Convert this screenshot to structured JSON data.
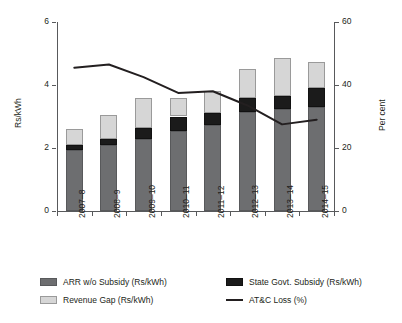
{
  "chart_data": {
    "type": "bar",
    "title": "",
    "subtitle": "",
    "xlabel": "",
    "ylabel": "Rs/kWh",
    "y2label": "Per cent",
    "categories": [
      "2007–8",
      "2008–9",
      "2009–10",
      "2010–11",
      "2011–12",
      "2012–13",
      "2013–14",
      "2014–15"
    ],
    "ylim": [
      0,
      6
    ],
    "yticks": [
      0,
      2,
      4,
      6
    ],
    "y2lim": [
      0,
      60
    ],
    "y2ticks": [
      0,
      20,
      40,
      60
    ],
    "grid": false,
    "legend_position": "bottom",
    "stacked": true,
    "series": [
      {
        "name": "ARR w/o Subsidy (Rs/kWh)",
        "kind": "bar",
        "axis": "left",
        "color": "#6d6e70",
        "values": [
          1.95,
          2.1,
          2.3,
          2.55,
          2.72,
          3.15,
          3.25,
          3.3
        ]
      },
      {
        "name": "State Govt. Subsidy (Rs/kWh)",
        "kind": "bar",
        "axis": "left",
        "color": "#1b1b1b",
        "values": [
          0.15,
          0.2,
          0.32,
          0.45,
          0.4,
          0.45,
          0.4,
          0.62
        ]
      },
      {
        "name": "Revenue Gap (Rs/kWh)",
        "kind": "bar",
        "axis": "left",
        "color": "#d6d6d6",
        "values": [
          0.5,
          0.75,
          0.98,
          0.6,
          0.68,
          0.9,
          1.2,
          0.8
        ]
      },
      {
        "name": "AT&C Loss (%)",
        "kind": "line",
        "axis": "right",
        "color": "#231f20",
        "values": [
          45.5,
          46.5,
          42.5,
          37.5,
          38.0,
          33.5,
          27.5,
          29.0
        ]
      }
    ],
    "stack_totals": [
      2.6,
      3.05,
      3.6,
      3.6,
      3.8,
      4.5,
      4.85,
      4.72
    ]
  },
  "axes": {
    "left": {
      "label": "Rs/kWh",
      "ticks": [
        "0",
        "2",
        "4",
        "6"
      ]
    },
    "right": {
      "label": "Per cent",
      "ticks": [
        "0",
        "20",
        "40",
        "60"
      ]
    },
    "bottom": {
      "ticks": [
        "2007–8",
        "2008–9",
        "2009–10",
        "2010–11",
        "2011–12",
        "2012–13",
        "2013–14",
        "2014–15"
      ]
    }
  },
  "legend": {
    "items": [
      {
        "label": "ARR w/o Subsidy (Rs/kWh)",
        "swatch": "arr-swatch"
      },
      {
        "label": "Revenue Gap (Rs/kWh)",
        "swatch": "gap-swatch"
      },
      {
        "label": "State Govt. Subsidy (Rs/kWh)",
        "swatch": "subsidy-swatch"
      },
      {
        "label": "AT&C Loss (%)",
        "swatch": "line-swatch"
      }
    ]
  },
  "colors": {
    "arr": "#6d6e70",
    "subsidy": "#1b1b1b",
    "gap": "#d6d6d6",
    "line": "#231f20",
    "axis": "#58595b",
    "background": "#ffffff"
  }
}
